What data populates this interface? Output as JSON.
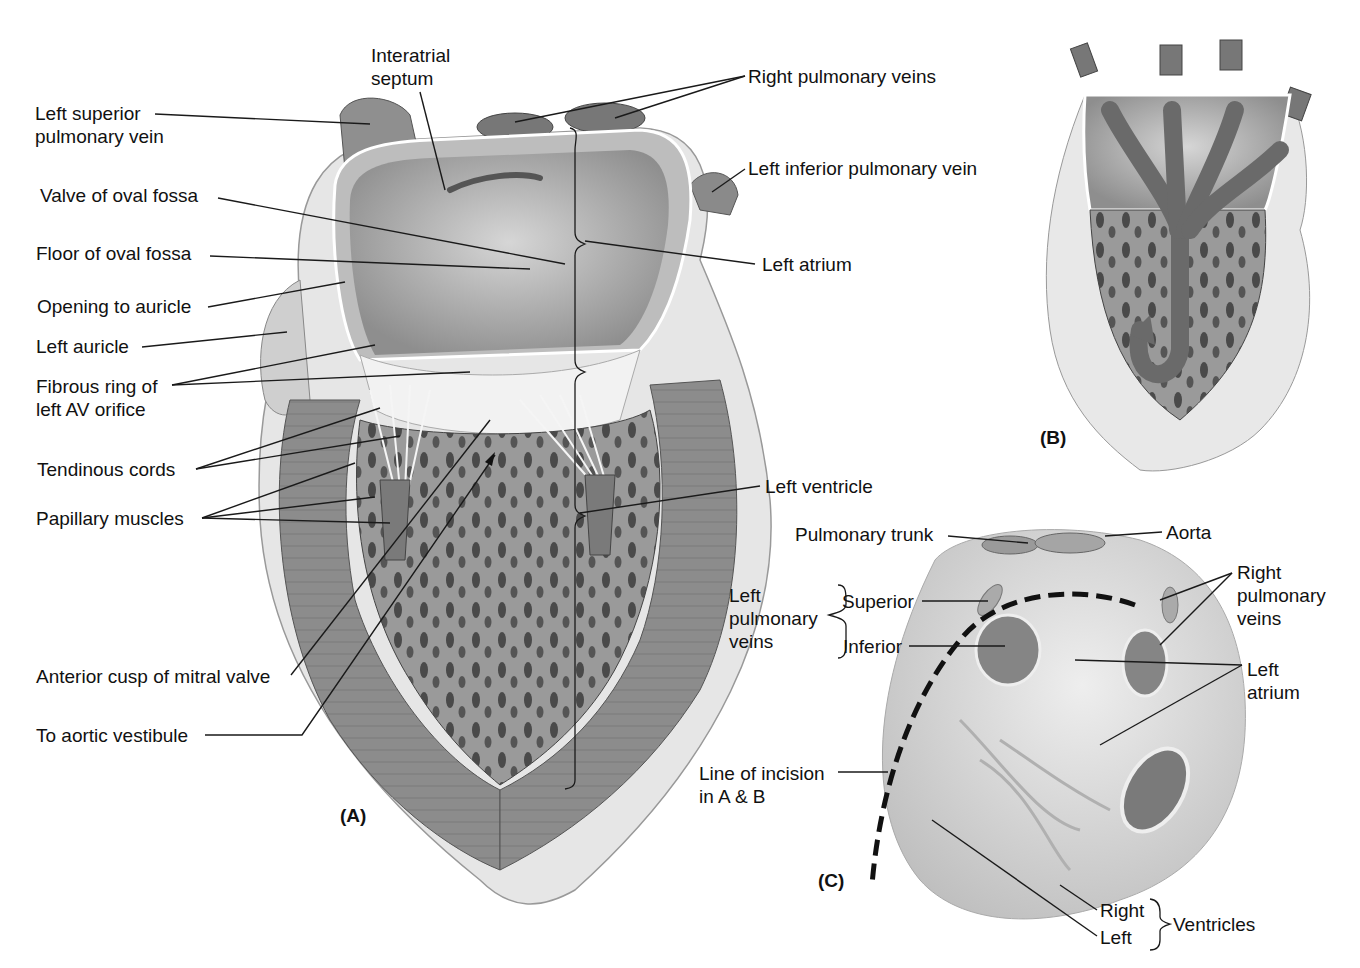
{
  "figure": {
    "panels": {
      "A": {
        "label": "(A)",
        "labels": {
          "interatrial_septum": "Interatrial\nseptum",
          "left_superior_pulmonary_vein": "Left superior\npulmonary vein",
          "valve_of_oval_fossa": "Valve of oval fossa",
          "floor_of_oval_fossa": "Floor of oval fossa",
          "opening_to_auricle": "Opening to auricle",
          "left_auricle": "Left auricle",
          "fibrous_ring": "Fibrous ring of\nleft AV orifice",
          "tendinous_cords": "Tendinous cords",
          "papillary_muscles": "Papillary muscles",
          "anterior_cusp": "Anterior cusp of mitral valve",
          "aortic_vestibule": "To aortic vestibule",
          "right_pulmonary_veins": "Right pulmonary veins",
          "left_inferior_pulmonary_vein": "Left inferior pulmonary vein",
          "left_atrium": "Left atrium",
          "left_ventricle": "Left ventricle"
        }
      },
      "B": {
        "label": "(B)"
      },
      "C": {
        "label": "(C)",
        "labels": {
          "pulmonary_trunk": "Pulmonary trunk",
          "aorta": "Aorta",
          "left_pulmonary_veins": "Left\npulmonary\nveins",
          "superior": "Superior",
          "inferior": "Inferior",
          "right_pulmonary_veins": "Right\npulmonary\nveins",
          "left_atrium": "Left\natrium",
          "line_of_incision": "Line of incision\nin A & B",
          "right": "Right",
          "left": "Left",
          "ventricles": "Ventricles"
        }
      }
    },
    "colors": {
      "background": "#ffffff",
      "tissue_light": "#d9d9d9",
      "tissue_mid": "#a8a8a8",
      "tissue_dark": "#6e6e6e",
      "myocardium": "#8f8f8f",
      "text": "#111111"
    }
  }
}
